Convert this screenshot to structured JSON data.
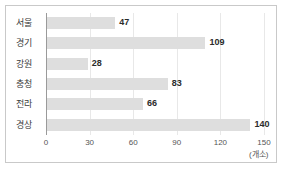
{
  "chart_data": {
    "type": "bar",
    "orientation": "horizontal",
    "title": "",
    "xlabel": "",
    "ylabel": "",
    "unit": "(개소)",
    "categories": [
      "서울",
      "경기",
      "강원",
      "충청",
      "전라",
      "경상"
    ],
    "values": [
      47,
      109,
      28,
      83,
      66,
      140
    ],
    "value_labels": [
      "47",
      "109",
      "28",
      "83",
      "66",
      "140"
    ],
    "xlim": [
      0,
      150
    ],
    "xticks": [
      0,
      30,
      60,
      90,
      120,
      150
    ],
    "xtick_labels": [
      "0",
      "30",
      "60",
      "90",
      "120",
      "150"
    ],
    "grid": true,
    "legend": false,
    "bar_color": "#dedede",
    "axis_color": "#9a9a9a",
    "grid_color": "#e8e8e8",
    "border_color": "#c9c9c9",
    "text_color": "#333333"
  }
}
